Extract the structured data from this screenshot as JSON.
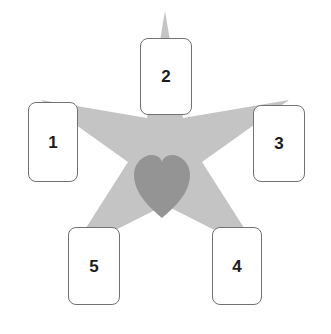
{
  "canvas": {
    "width": 331,
    "height": 334,
    "background_color": "#ffffff"
  },
  "diagram": {
    "name": "five-pointed-star-with-heart-and-numbered-cards",
    "star": {
      "icon": "star-icon",
      "fill_color": "#c4c4c4",
      "points": 5,
      "center_x": 165,
      "center_y": 163,
      "outer_radius": 152,
      "inner_radius": 62
    },
    "heart": {
      "icon": "heart-icon",
      "fill_color": "#949494",
      "center_x": 162,
      "center_y": 186,
      "width": 56,
      "height": 63
    }
  },
  "cards": [
    {
      "id": "card-1",
      "label": "1",
      "position": "left"
    },
    {
      "id": "card-2",
      "label": "2",
      "position": "top"
    },
    {
      "id": "card-3",
      "label": "3",
      "position": "right"
    },
    {
      "id": "card-4",
      "label": "4",
      "position": "bottom-right"
    },
    {
      "id": "card-5",
      "label": "5",
      "position": "bottom-left"
    }
  ],
  "style": {
    "card_background": "#ffffff",
    "card_border_color": "#6f7275",
    "card_label_color": "#1c1c1c",
    "card_corner_radius": 8
  }
}
